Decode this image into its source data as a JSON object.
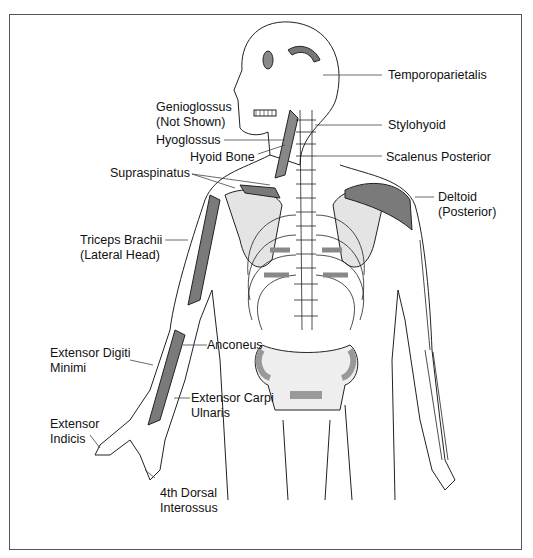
{
  "diagram": {
    "labels": [
      {
        "id": "temporoparietalis",
        "lines": [
          "Temporoparietalis"
        ]
      },
      {
        "id": "genioglossus",
        "lines": [
          "Genioglossus",
          "(Not Shown)"
        ]
      },
      {
        "id": "stylohyoid",
        "lines": [
          "Stylohyoid"
        ]
      },
      {
        "id": "hyoglossus",
        "lines": [
          "Hyoglossus"
        ]
      },
      {
        "id": "hyoid_bone",
        "lines": [
          "Hyoid Bone"
        ]
      },
      {
        "id": "scalenus_posterior",
        "lines": [
          "Scalenus Posterior"
        ]
      },
      {
        "id": "supraspinatus",
        "lines": [
          "Supraspinatus"
        ]
      },
      {
        "id": "deltoid",
        "lines": [
          "Deltoid",
          "(Posterior)"
        ]
      },
      {
        "id": "triceps",
        "lines": [
          "Triceps Brachii",
          "(Lateral Head)"
        ]
      },
      {
        "id": "anconeus",
        "lines": [
          "Anconeus"
        ]
      },
      {
        "id": "ext_digiti_minimi",
        "lines": [
          "Extensor Digiti",
          "Minimi"
        ]
      },
      {
        "id": "ext_carpi_ulnaris",
        "lines": [
          "Extensor Carpi",
          "Ulnaris"
        ]
      },
      {
        "id": "ext_indicis",
        "lines": [
          "Extensor",
          "Indicis"
        ]
      },
      {
        "id": "dorsal_interossus",
        "lines": [
          "4th Dorsal",
          "Interossus"
        ]
      }
    ],
    "colors": {
      "line": "#222222",
      "bone_shade": "#c8c8c8",
      "muscle": "#7a7a7a",
      "frame": "#555555"
    }
  }
}
